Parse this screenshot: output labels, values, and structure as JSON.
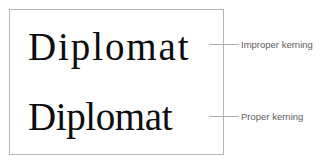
{
  "figure": {
    "background_color": "#ffffff",
    "box_border_color": "#b6b6b6",
    "leader_line_color": "#b0b0b0",
    "specimen_text_color": "#0d0d0d",
    "label_text_color": "#5d5d5d"
  },
  "specimens": [
    {
      "id": "improper",
      "word": "Diplomat",
      "label": "Improper kerning",
      "letter_spacing": "loose"
    },
    {
      "id": "proper",
      "word": "Diplomat",
      "label": "Proper kerning",
      "letter_spacing": "tight"
    }
  ]
}
